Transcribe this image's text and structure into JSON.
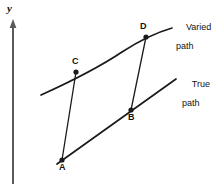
{
  "figure": {
    "background_color": "#ffffff",
    "stroke_color": "#1a1a1a",
    "axis": {
      "name": "y-axis",
      "label": "y",
      "label_x": 7,
      "label_y": 4,
      "line_x": 13,
      "line_top": 23,
      "line_bottom": 184,
      "arrow": "up"
    },
    "points": [
      {
        "id": "A",
        "label": "A",
        "x": 62,
        "y": 160,
        "label_x": 59,
        "label_y": 163
      },
      {
        "id": "B",
        "label": "B",
        "x": 131,
        "y": 110,
        "label_x": 128,
        "label_y": 113
      },
      {
        "id": "C",
        "label": "C",
        "x": 76,
        "y": 72,
        "label_x": 72,
        "label_y": 57
      },
      {
        "id": "D",
        "label": "D",
        "x": 146,
        "y": 37,
        "label_x": 140,
        "label_y": 22
      }
    ],
    "curves": [
      {
        "id": "varied-path",
        "label_line1": "Varied",
        "label_line2": "path",
        "label_x": 176,
        "label_y": 14,
        "kind": "curve",
        "d": "M 41 95 Q 92 72 122 52 Q 148 35 172 28"
      },
      {
        "id": "true-path",
        "label_line1": "True",
        "label_line2": "path",
        "label_x": 182,
        "label_y": 71,
        "kind": "line",
        "d": "M 57 164 L 176 79"
      }
    ],
    "connectors": [
      {
        "id": "connector-A-C",
        "from": "A",
        "to": "C",
        "d": "M 62 160 L 76 72"
      },
      {
        "id": "connector-B-D",
        "from": "B",
        "to": "D",
        "d": "M 131 110 L 146 37"
      }
    ]
  }
}
